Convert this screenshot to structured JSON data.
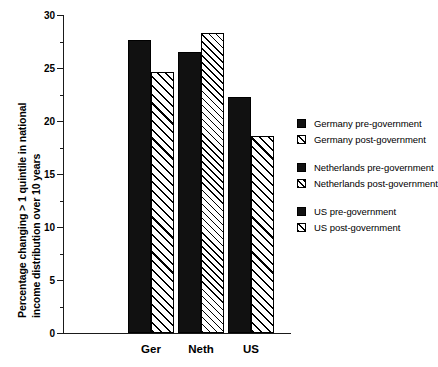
{
  "chart_data": {
    "type": "bar",
    "title": "",
    "xlabel": "",
    "ylabel": "Percentage changing > 1 quintile in national income distribution over 10 years",
    "ylabel_lines": [
      "Percentage changing > 1 quintile in national",
      "income distribution over 10 years"
    ],
    "categories": [
      "Ger",
      "Neth",
      "US"
    ],
    "ylim": [
      0,
      30
    ],
    "yticks": [
      0,
      5,
      10,
      15,
      20,
      25,
      30
    ],
    "ytick_labels": [
      "0",
      "5",
      "10",
      "15",
      "20",
      "25",
      "30"
    ],
    "yminor_ticks": [
      2.5,
      7.5,
      12.5,
      17.5,
      22.5,
      27.5
    ],
    "grid": false,
    "legend_position": "right",
    "series": [
      {
        "name": "pre-government",
        "values": [
          27.6,
          26.5,
          22.3
        ],
        "fill": "solid"
      },
      {
        "name": "post-government",
        "values": [
          24.6,
          28.3,
          18.6
        ],
        "fill": "hatch"
      }
    ],
    "bars": [
      {
        "group": "Ger",
        "label": "Germany pre-government",
        "value": 27.6,
        "fill": "solid"
      },
      {
        "group": "Ger",
        "label": "Germany post-government",
        "value": 24.6,
        "fill": "hatch"
      },
      {
        "group": "Neth",
        "label": "Netherlands pre-government",
        "value": 26.5,
        "fill": "solid"
      },
      {
        "group": "Neth",
        "label": "Netherlands post-government",
        "value": 28.3,
        "fill": "hatch-fine"
      },
      {
        "group": "US",
        "label": "US pre-government",
        "value": 22.3,
        "fill": "solid"
      },
      {
        "group": "US",
        "label": "US post-government",
        "value": 18.6,
        "fill": "hatch"
      }
    ],
    "legend": [
      {
        "label": "Germany pre-government",
        "fill": "solid"
      },
      {
        "label": "Germany post-government",
        "fill": "hatch"
      },
      {
        "label": "Netherlands pre-government",
        "fill": "solid"
      },
      {
        "label": "Netherlands post-government",
        "fill": "hatch-fine"
      },
      {
        "label": "US pre-government",
        "fill": "solid"
      },
      {
        "label": "US post-government",
        "fill": "hatch"
      }
    ],
    "colors": {
      "solid_fill": "#111111",
      "hatch_fill": "#ffffff",
      "hatch_line": "#000000",
      "axis": "#1a1a1a",
      "background": "#ffffff"
    }
  }
}
